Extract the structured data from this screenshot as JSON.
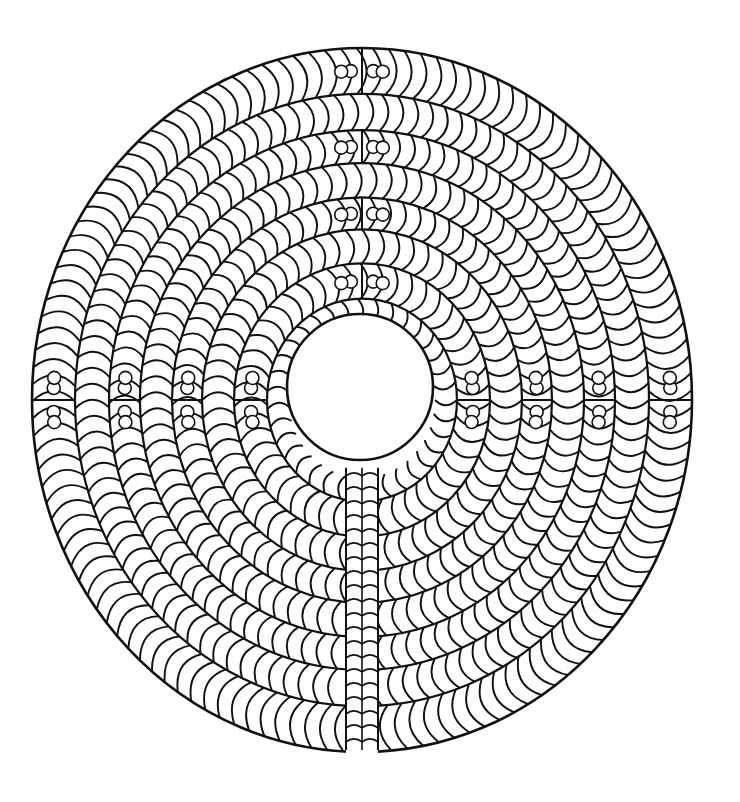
{
  "figure": {
    "colors": {
      "ink": "#111111",
      "paper": "#ffffff"
    },
    "center": [
      362,
      400
    ],
    "outer_radius_x": 330,
    "outer_radius_y": 352,
    "inner_hole": {
      "center": [
        360,
        387
      ],
      "radius": 73
    },
    "ring_radii": [
      73,
      95,
      128,
      160,
      190,
      222,
      253,
      287,
      330
    ],
    "bottom_slit": {
      "x": 362,
      "half_width": 16
    },
    "plaques": {
      "axes_deg": [
        0,
        90,
        180,
        270
      ],
      "description": "rectangular plaques with paired small circles and a dark tadpole mark, placed where rings turn on the cardinal axes"
    }
  }
}
